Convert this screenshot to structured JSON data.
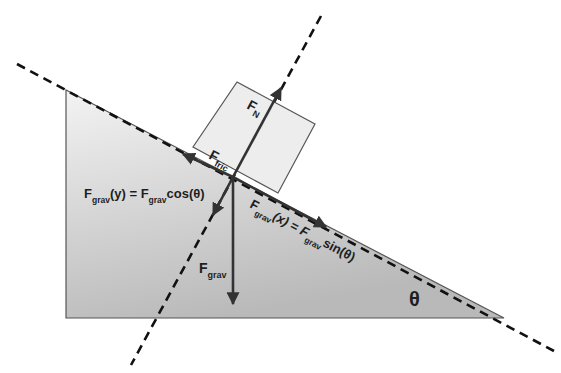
{
  "diagram": {
    "type": "free-body-diagram",
    "colors": {
      "background": "#ffffff",
      "incline_fill_top": "#f2f2f2",
      "incline_fill_bottom": "#bdbdbd",
      "block_fill": "#ececec",
      "stroke": "#333333",
      "dashed": "#111111",
      "text": "#1e1e1e"
    },
    "labels": {
      "normal_force": {
        "main": "F",
        "sub": "N"
      },
      "friction_force": {
        "main": "F",
        "sub": "fric"
      },
      "gravity_force": {
        "main": "F",
        "sub": "grav"
      },
      "gravity_y": {
        "main": "F",
        "sub": "grav",
        "mid": "(y) = F",
        "sub2": "grav",
        "tail": "cos(θ)"
      },
      "gravity_x": {
        "main": "F",
        "sub": "grav",
        "mid": "(x) = F",
        "sub2": "grav",
        "tail": "sin(θ)"
      },
      "angle": "θ"
    }
  }
}
